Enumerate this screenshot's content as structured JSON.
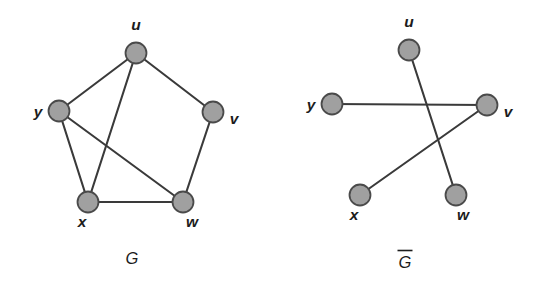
{
  "figure": {
    "background_color": "#ffffff",
    "vertex_fill": "#a0a0a0",
    "vertex_stroke": "#4a4a4a",
    "edge_color": "#3a3a3a",
    "label_color": "#1c1c1c",
    "vertex_radius": 10.5
  },
  "graphs": [
    {
      "id": "graph-g",
      "caption": "G",
      "caption_overbar": false,
      "caption_x": 132,
      "caption_y": 264,
      "vertices": [
        {
          "id": "u",
          "label": "u",
          "cx": 136,
          "cy": 53,
          "label_x": 136,
          "label_y": 30,
          "label_anchor": "middle"
        },
        {
          "id": "y",
          "label": "y",
          "cx": 59,
          "cy": 111,
          "label_x": 38,
          "label_y": 117,
          "label_anchor": "middle"
        },
        {
          "id": "v",
          "label": "v",
          "cx": 213,
          "cy": 112,
          "label_x": 234,
          "label_y": 124,
          "label_anchor": "middle"
        },
        {
          "id": "x",
          "label": "x",
          "cx": 88,
          "cy": 202,
          "label_x": 82,
          "label_y": 227,
          "label_anchor": "middle"
        },
        {
          "id": "w",
          "label": "w",
          "cx": 183,
          "cy": 202,
          "label_x": 192,
          "label_y": 227,
          "label_anchor": "middle"
        }
      ],
      "edges": [
        {
          "from": "u",
          "to": "y"
        },
        {
          "from": "u",
          "to": "v"
        },
        {
          "from": "u",
          "to": "x"
        },
        {
          "from": "y",
          "to": "x"
        },
        {
          "from": "y",
          "to": "w"
        },
        {
          "from": "v",
          "to": "w"
        },
        {
          "from": "x",
          "to": "w"
        }
      ]
    },
    {
      "id": "graph-g-complement",
      "caption": "G",
      "caption_overbar": true,
      "caption_x": 405,
      "caption_y": 268,
      "vertices": [
        {
          "id": "u",
          "label": "u",
          "cx": 409,
          "cy": 50,
          "label_x": 409,
          "label_y": 27,
          "label_anchor": "middle"
        },
        {
          "id": "y",
          "label": "y",
          "cx": 332,
          "cy": 104,
          "label_x": 311,
          "label_y": 110,
          "label_anchor": "middle"
        },
        {
          "id": "v",
          "label": "v",
          "cx": 487,
          "cy": 105,
          "label_x": 508,
          "label_y": 117,
          "label_anchor": "middle"
        },
        {
          "id": "x",
          "label": "x",
          "cx": 360,
          "cy": 195,
          "label_x": 354,
          "label_y": 220,
          "label_anchor": "middle"
        },
        {
          "id": "w",
          "label": "w",
          "cx": 456,
          "cy": 195,
          "label_x": 463,
          "label_y": 220,
          "label_anchor": "middle"
        }
      ],
      "edges": [
        {
          "from": "u",
          "to": "w"
        },
        {
          "from": "y",
          "to": "v"
        },
        {
          "from": "x",
          "to": "v"
        }
      ]
    }
  ]
}
